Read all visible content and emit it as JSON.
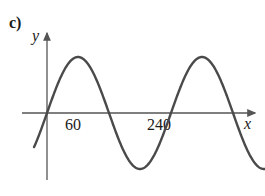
{
  "figure": {
    "part_label": "c)",
    "background_color": "#ffffff"
  },
  "axes": {
    "x_label": "x",
    "y_label": "y",
    "axis_color": "#555555",
    "x_axis_pixel_y": 113,
    "y_axis_pixel_x": 47
  },
  "ticks": {
    "x": [
      {
        "label": "60",
        "value": 60
      },
      {
        "label": "240",
        "value": 240
      }
    ]
  },
  "chart_data": {
    "type": "line",
    "title": "c)",
    "xlabel": "x",
    "ylabel": "y",
    "grid": false,
    "legend": null,
    "curve_color": "#4a4a4a",
    "xticks": [
      60,
      240
    ],
    "xticklabels": [
      "60",
      "240"
    ],
    "xlim": [
      -25,
      495
    ],
    "ylim": [
      -1.25,
      1.25
    ],
    "series": [
      {
        "name": "y = sin(x)",
        "x": [
          -25,
          -10,
          0,
          20,
          40,
          60,
          80,
          100,
          120,
          140,
          160,
          180,
          200,
          220,
          240,
          260,
          280,
          300,
          320,
          340,
          360,
          380,
          400,
          420,
          440,
          460,
          480,
          490
        ],
        "y": [
          -1.1,
          -0.72,
          0,
          0.34,
          0.64,
          1.0,
          0.98,
          0.64,
          0,
          -0.34,
          -0.64,
          -1.0,
          -0.98,
          -0.64,
          0,
          0.34,
          0.64,
          1.0,
          0.98,
          0.64,
          0,
          -0.34,
          -0.64,
          -1.0,
          -0.98,
          -0.64,
          0,
          0.6
        ]
      }
    ],
    "zero_crossings": [
      0,
      120,
      240,
      360,
      480
    ],
    "maxima": [
      {
        "x": 60,
        "y": 1
      },
      {
        "x": 300,
        "y": 1
      }
    ],
    "minima": [
      {
        "x": 180,
        "y": -1
      },
      {
        "x": 420,
        "y": -1
      }
    ],
    "period": 240,
    "amplitude": 1
  }
}
